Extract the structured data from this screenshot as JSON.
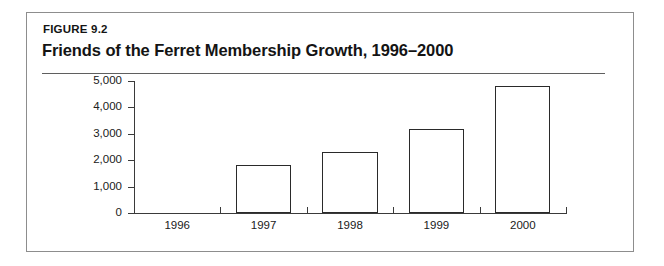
{
  "figure": {
    "label": "FIGURE 9.2",
    "title": "Friends of the Ferret Membership Growth, 1996–2000"
  },
  "chart_data": {
    "type": "bar",
    "title": "Friends of the Ferret Membership Growth, 1996–2000",
    "categories": [
      "1996",
      "1997",
      "1998",
      "1999",
      "2000"
    ],
    "values": [
      0,
      1800,
      2300,
      3200,
      4800
    ],
    "series": [
      {
        "name": "Membership",
        "values": [
          0,
          1800,
          2300,
          3200,
          4800
        ]
      }
    ],
    "xlabel": "",
    "ylabel": "",
    "ylim": [
      0,
      5000
    ],
    "ytick_labels": [
      "0",
      "1,000",
      "2,000",
      "3,000",
      "4,000",
      "5,000"
    ],
    "ytick_values": [
      0,
      1000,
      2000,
      3000,
      4000,
      5000
    ],
    "xtick_labels": [
      "1996",
      "1997",
      "1998",
      "1999",
      "2000"
    ],
    "grid": false,
    "legend": false,
    "bar_fill": "#ffffff",
    "bar_outline": "#2a2a2a",
    "axis_color": "#3a3a3a"
  }
}
